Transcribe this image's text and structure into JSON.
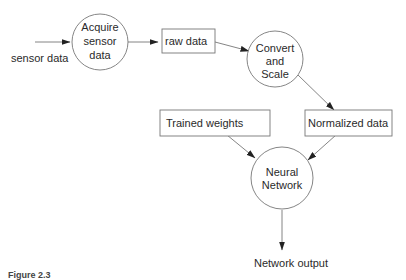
{
  "diagram": {
    "type": "data-flow",
    "nodes": [
      {
        "id": "acquire",
        "shape": "circle",
        "lines": [
          "Acquire",
          "sensor",
          "data"
        ]
      },
      {
        "id": "raw",
        "shape": "rect",
        "label": "raw data"
      },
      {
        "id": "convert",
        "shape": "circle",
        "lines": [
          "Convert",
          "and",
          "Scale"
        ]
      },
      {
        "id": "weights",
        "shape": "rect",
        "label": "Trained weights"
      },
      {
        "id": "normalized",
        "shape": "rect",
        "label": "Normalized data"
      },
      {
        "id": "nn",
        "shape": "circle",
        "lines": [
          "Neural",
          "Network"
        ]
      }
    ],
    "labels": {
      "input": "sensor data",
      "output": "Network output"
    },
    "edges": [
      {
        "from": "input",
        "to": "acquire"
      },
      {
        "from": "acquire",
        "to": "raw"
      },
      {
        "from": "raw",
        "to": "convert"
      },
      {
        "from": "convert",
        "to": "normalized"
      },
      {
        "from": "weights",
        "to": "nn"
      },
      {
        "from": "normalized",
        "to": "nn"
      },
      {
        "from": "nn",
        "to": "output"
      }
    ],
    "caption": "Figure 2.3"
  }
}
